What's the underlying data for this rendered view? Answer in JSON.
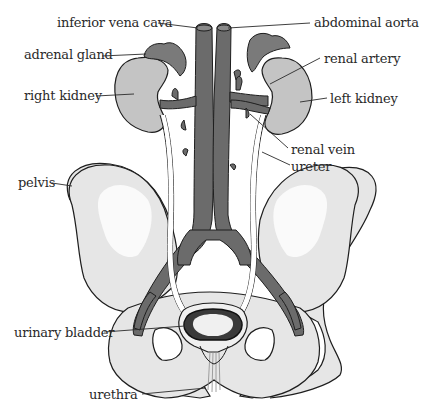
{
  "diagram": {
    "colors": {
      "vessel": "#6b6b6b",
      "kidney": "#c4c4c4",
      "adrenal": "#7a7a7a",
      "bone": "#e6e6e6",
      "bone_highlight": "#fafafa",
      "ureter": "#ffffff",
      "outline": "#1e1e1e",
      "label_text": "#2a2a2a"
    },
    "labels": {
      "inferior_vena_cava": "inferior vena cava",
      "abdominal_aorta": "abdominal aorta",
      "adrenal_gland": "adrenal gland",
      "renal_artery": "renal artery",
      "right_kidney": "right kidney",
      "left_kidney": "left kidney",
      "renal_vein": "renal vein",
      "ureter": "ureter",
      "pelvis": "pelvis",
      "urinary_bladder": "urinary bladder",
      "urethra": "urethra"
    }
  }
}
